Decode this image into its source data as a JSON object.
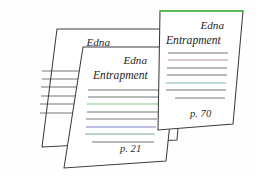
{
  "scene": {
    "name": "document-stack",
    "background_color": "#fefefe",
    "card_fill": "#ffffff",
    "card_stroke": "#3c3c3c",
    "highlight_color": "#46c24a"
  },
  "cards": [
    {
      "id": "card-back",
      "title": "Edna",
      "subtitle": "Entrapment",
      "page_label": "",
      "outline": "42,147 57,29 186,29 177,140",
      "top_highlight": false,
      "top_highlight_color": "",
      "title_x": 110,
      "title_y": 46,
      "subtitle_x": 98,
      "subtitle_y": 60,
      "page_x": 0,
      "page_y": 0,
      "lines": [
        {
          "x1": 42,
          "y1": 71,
          "x2": 113,
          "y2": 71,
          "color": "#6f7277"
        },
        {
          "x1": 42,
          "y1": 79,
          "x2": 113,
          "y2": 79,
          "color": "#6f7277"
        },
        {
          "x1": 41,
          "y1": 87,
          "x2": 112,
          "y2": 87,
          "color": "#7a6f6c"
        },
        {
          "x1": 41,
          "y1": 96,
          "x2": 112,
          "y2": 96,
          "color": "#6e737d"
        },
        {
          "x1": 40,
          "y1": 104,
          "x2": 111,
          "y2": 104,
          "color": "#6f7277"
        },
        {
          "x1": 40,
          "y1": 113,
          "x2": 100,
          "y2": 113,
          "color": "#75787d"
        }
      ]
    },
    {
      "id": "card-middle",
      "title": "Edna",
      "subtitle": "Entrapment",
      "page_label": "p. 21",
      "outline": "64,168 83,47 178,47 166,161",
      "top_highlight": false,
      "top_highlight_color": "",
      "title_x": 147,
      "title_y": 64,
      "subtitle_x": 93,
      "subtitle_y": 79,
      "page_x": 120,
      "page_y": 152,
      "lines": [
        {
          "x1": 88,
          "y1": 90,
          "x2": 159,
          "y2": 90,
          "color": "#6f7277"
        },
        {
          "x1": 88,
          "y1": 97,
          "x2": 159,
          "y2": 97,
          "color": "#70747b"
        },
        {
          "x1": 87,
          "y1": 104,
          "x2": 158,
          "y2": 104,
          "color": "#7bc97f"
        },
        {
          "x1": 87,
          "y1": 112,
          "x2": 158,
          "y2": 112,
          "color": "#6f7277"
        },
        {
          "x1": 86,
          "y1": 119,
          "x2": 157,
          "y2": 119,
          "color": "#72757a"
        },
        {
          "x1": 86,
          "y1": 127,
          "x2": 156,
          "y2": 127,
          "color": "#7b7ec9"
        },
        {
          "x1": 85,
          "y1": 134,
          "x2": 155,
          "y2": 134,
          "color": "#76a5a0"
        },
        {
          "x1": 92,
          "y1": 142,
          "x2": 154,
          "y2": 142,
          "color": "#6f7277"
        }
      ]
    },
    {
      "id": "card-front",
      "title": "Edna",
      "subtitle": "Entrapment",
      "page_label": "p. 70",
      "outline": "158,130 160,11 243,11 233,124",
      "top_highlight": true,
      "top_highlight_color": "#46c24a",
      "title_x": 224,
      "title_y": 29,
      "subtitle_x": 166,
      "subtitle_y": 44,
      "page_x": 190,
      "page_y": 117,
      "lines": [
        {
          "x1": 168,
          "y1": 53,
          "x2": 228,
          "y2": 53,
          "color": "#6f7277"
        },
        {
          "x1": 168,
          "y1": 60,
          "x2": 228,
          "y2": 60,
          "color": "#b09094"
        },
        {
          "x1": 167,
          "y1": 68,
          "x2": 227,
          "y2": 68,
          "color": "#6f7277"
        },
        {
          "x1": 167,
          "y1": 75,
          "x2": 227,
          "y2": 75,
          "color": "#72757a"
        },
        {
          "x1": 166,
          "y1": 83,
          "x2": 226,
          "y2": 83,
          "color": "#7fb5bb"
        },
        {
          "x1": 166,
          "y1": 90,
          "x2": 226,
          "y2": 90,
          "color": "#6f7277"
        },
        {
          "x1": 175,
          "y1": 98,
          "x2": 225,
          "y2": 98,
          "color": "#75787d"
        }
      ]
    }
  ]
}
